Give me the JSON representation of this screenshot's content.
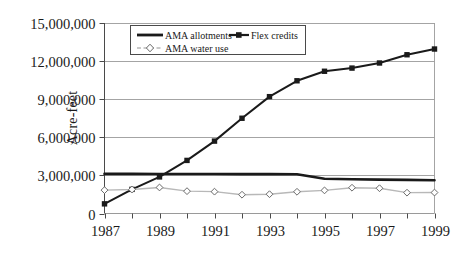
{
  "chart_data": {
    "type": "line",
    "title": "",
    "xlabel": "",
    "ylabel": "Acre-feet",
    "x": [
      1987,
      1988,
      1989,
      1990,
      1991,
      1992,
      1993,
      1994,
      1995,
      1996,
      1997,
      1998,
      1999
    ],
    "xtick_labels": [
      "1987",
      "",
      "1989",
      "",
      "1991",
      "",
      "1993",
      "",
      "1995",
      "",
      "1997",
      "",
      "1999"
    ],
    "xtick_labels_all": [
      "1987",
      "1988",
      "1989",
      "1990",
      "1991",
      "1992",
      "1993",
      "1994",
      "1995",
      "1996",
      "1997",
      "1998",
      "1999"
    ],
    "xlim": [
      1987,
      1999
    ],
    "ylim": [
      0,
      15000000
    ],
    "ytick_values": [
      0,
      3000000,
      6000000,
      9000000,
      12000000,
      15000000
    ],
    "ytick_labels": [
      "0",
      "3,000,000",
      "6,000,000",
      "9,000,000",
      "12,000,000",
      "15,000,000"
    ],
    "grid": "horizontal",
    "legend_position": "top-center",
    "series": [
      {
        "name": "AMA allotments",
        "color": "#1a1a1a",
        "marker": "none",
        "linestyle": "solid",
        "linewidth": 2.6,
        "values": [
          3120000,
          3120000,
          3110000,
          3110000,
          3105000,
          3100000,
          3100000,
          3090000,
          2740000,
          2700000,
          2670000,
          2650000,
          2620000
        ]
      },
      {
        "name": "Flex credits",
        "color": "#1a1a1a",
        "marker": "square",
        "linestyle": "solid",
        "linewidth": 2.0,
        "values": [
          760000,
          1900000,
          2880000,
          4180000,
          5700000,
          7500000,
          9200000,
          10450000,
          11200000,
          11450000,
          11850000,
          12500000,
          12950000
        ]
      },
      {
        "name": "AMA water use",
        "color": "#b8b8b8",
        "marker": "diamond",
        "linestyle": "solid",
        "linewidth": 1.4,
        "values": [
          1840000,
          1890000,
          2050000,
          1760000,
          1720000,
          1480000,
          1520000,
          1710000,
          1820000,
          2030000,
          1990000,
          1640000,
          1650000
        ]
      }
    ]
  },
  "legend": {
    "entries": [
      {
        "label": "AMA allotments",
        "key": "ama-allotments"
      },
      {
        "label": "Flex credits",
        "key": "flex-credits"
      },
      {
        "label": "AMA water use",
        "key": "ama-water-use"
      }
    ]
  },
  "axis": {
    "y_title": "Acre-feet"
  }
}
